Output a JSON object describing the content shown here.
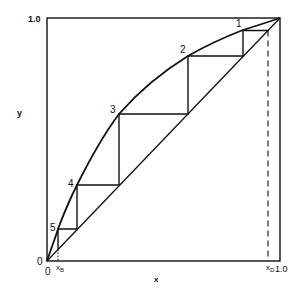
{
  "diagram": {
    "type": "McCabe-Thiele equilibrium staircase",
    "axes": {
      "x_label": "x",
      "y_label": "y",
      "y_top_tick": "1.0",
      "x_right_tick": "1.0",
      "origin_y": "0",
      "origin_x": "0",
      "x_b_label": "x",
      "x_b_sub": "B",
      "x_d_label": "x",
      "x_d_sub": "D"
    },
    "stage_labels": [
      "1",
      "2",
      "3",
      "4",
      "5"
    ],
    "colors": {
      "line": "#111111",
      "background": "#ffffff"
    }
  }
}
